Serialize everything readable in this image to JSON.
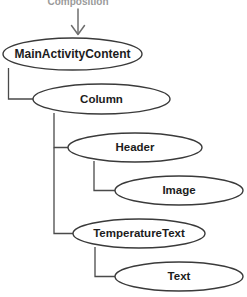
{
  "diagram": {
    "type": "tree",
    "title_caption": "Composition",
    "caption_clipped": true,
    "background_color": "#ffffff",
    "node_stroke_color": "#3a3a3a",
    "node_fill_color": "#ffffff",
    "connector_color": "#4a4a4a",
    "label_color": "#1c1c1c",
    "arrow_color": "#6e6e6e",
    "entry_arrow": {
      "name": "composition-entry-arrow",
      "direction": "down",
      "from_x": 78,
      "from_y": 10,
      "to_x": 78,
      "to_y": 35
    },
    "nodes": [
      {
        "id": "main-activity-content",
        "label": "MainActivityContent",
        "cx": 72.5,
        "cy": 54,
        "rx": 69.5,
        "ry": 16,
        "font_size": 12,
        "depth": 0,
        "parent": null
      },
      {
        "id": "column",
        "label": "Column",
        "cx": 101.5,
        "cy": 99,
        "rx": 68.5,
        "ry": 15,
        "font_size": 11.5,
        "depth": 1,
        "parent": "main-activity-content"
      },
      {
        "id": "header",
        "label": "Header",
        "cx": 135,
        "cy": 147.5,
        "rx": 67,
        "ry": 14.5,
        "font_size": 11.5,
        "depth": 2,
        "parent": "column"
      },
      {
        "id": "image",
        "label": "Image",
        "cx": 179,
        "cy": 190.5,
        "rx": 64,
        "ry": 14.5,
        "font_size": 11.5,
        "depth": 3,
        "parent": "header"
      },
      {
        "id": "temperature-text",
        "label": "TemperatureText",
        "cx": 139,
        "cy": 233.5,
        "rx": 66,
        "ry": 14.5,
        "font_size": 11.5,
        "depth": 2,
        "parent": "column"
      },
      {
        "id": "text",
        "label": "Text",
        "cx": 179,
        "cy": 276.5,
        "rx": 64,
        "ry": 14.5,
        "font_size": 11.5,
        "depth": 3,
        "parent": "temperature-text"
      }
    ],
    "connectors": [
      {
        "id": "main-to-column",
        "from": "main-activity-content",
        "to": "column",
        "path": "M 8.5 68 L 8.5 99 L 33 99"
      },
      {
        "id": "column-to-header",
        "from": "column",
        "to": "header",
        "path": "M 54 113 L 54 147.5 L 68 147.5"
      },
      {
        "id": "header-to-image",
        "from": "header",
        "to": "image",
        "path": "M 94 161 L 94 190.5 L 115 190.5"
      },
      {
        "id": "column-to-temperaturetext",
        "from": "column",
        "to": "temperature-text",
        "path": "M 54 147.5 L 54 233.5 L 73 233.5"
      },
      {
        "id": "temperaturetext-to-text",
        "from": "temperature-text",
        "to": "text",
        "path": "M 95 247 L 95 276.5 L 115 276.5"
      }
    ]
  }
}
